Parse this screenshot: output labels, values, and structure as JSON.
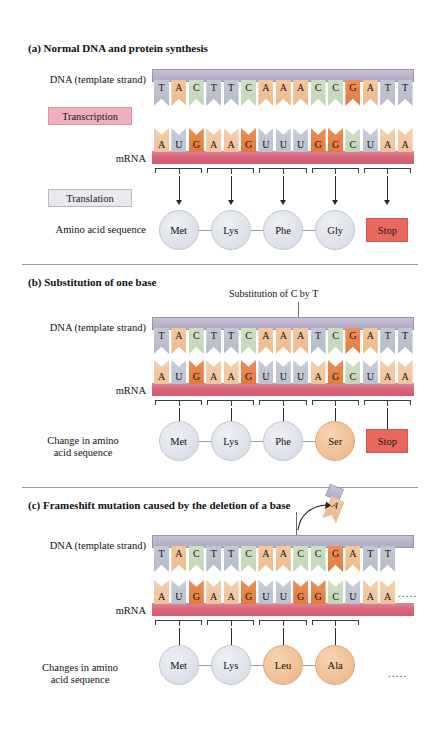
{
  "figure": {
    "type": "biology-diagram"
  },
  "colors": {
    "base_T": "#b6bbc9",
    "base_A": "#eeba8b",
    "base_C": "#c2d6b4",
    "base_G": "#e27a3e",
    "base_U": "#bcc1ce",
    "dna_backbone": "#b3aac4",
    "mrna_backbone": "#d4596f",
    "transcription_box": "#f0afbc",
    "translation_box": "#e8e8ee",
    "amino_acid_normal": "#dfe2ea",
    "amino_acid_changed": "#f0c096",
    "stop_codon": "#e8685f"
  },
  "labels": {
    "dna_strand": "DNA (template strand)",
    "mrna": "mRNA",
    "transcription": "Transcription",
    "translation": "Translation",
    "amino_acid_sequence": "Amino acid sequence",
    "change_in_amino_acid_sequence_line1": "Change in amino",
    "change_in_amino_acid_sequence_line2": "acid sequence",
    "changes_in_amino_acid_sequence_line1": "Changes in amino",
    "changes_in_amino_acid_sequence_line2": "acid sequence",
    "stop": "Stop",
    "ellipsis": "....."
  },
  "panels": [
    {
      "id": "a",
      "marker": "(a)",
      "title": "Normal DNA and protein synthesis",
      "dna_sequence": [
        "T",
        "A",
        "C",
        "T",
        "T",
        "C",
        "A",
        "A",
        "A",
        "C",
        "C",
        "G",
        "A",
        "T",
        "T"
      ],
      "mrna_sequence": [
        "A",
        "U",
        "G",
        "A",
        "A",
        "G",
        "U",
        "U",
        "U",
        "G",
        "G",
        "C",
        "U",
        "A",
        "A"
      ],
      "codons": [
        "AUG",
        "AAG",
        "UUU",
        "GGC",
        "UAA"
      ],
      "amino_acids": [
        {
          "name": "Met",
          "changed": false
        },
        {
          "name": "Lys",
          "changed": false
        },
        {
          "name": "Phe",
          "changed": false
        },
        {
          "name": "Gly",
          "changed": false
        }
      ],
      "terminator": "Stop",
      "annotation": null,
      "trailing_ellipsis": false
    },
    {
      "id": "b",
      "marker": "(b)",
      "title": "Substitution of one base",
      "dna_sequence": [
        "T",
        "A",
        "C",
        "T",
        "T",
        "C",
        "A",
        "A",
        "A",
        "T",
        "C",
        "G",
        "A",
        "T",
        "T"
      ],
      "mrna_sequence": [
        "A",
        "U",
        "G",
        "A",
        "A",
        "G",
        "U",
        "U",
        "U",
        "A",
        "G",
        "C",
        "U",
        "A",
        "A"
      ],
      "codons": [
        "AUG",
        "AAG",
        "UUU",
        "AGC",
        "UAA"
      ],
      "amino_acids": [
        {
          "name": "Met",
          "changed": false
        },
        {
          "name": "Lys",
          "changed": false
        },
        {
          "name": "Phe",
          "changed": false
        },
        {
          "name": "Ser",
          "changed": true
        }
      ],
      "terminator": "Stop",
      "annotation": "Substitution of C by T",
      "annotation_target_index": 9,
      "trailing_ellipsis": false
    },
    {
      "id": "c",
      "marker": "(c)",
      "title": "Frameshift mutation caused by the deletion of a base",
      "dna_sequence": [
        "T",
        "A",
        "C",
        "T",
        "T",
        "C",
        "A",
        "A",
        "C",
        "C",
        "G",
        "A",
        "T",
        "T"
      ],
      "mrna_sequence": [
        "A",
        "U",
        "G",
        "A",
        "A",
        "G",
        "U",
        "U",
        "G",
        "G",
        "C",
        "U",
        "A",
        "A"
      ],
      "codons": [
        "AUG",
        "AAG",
        "UUG",
        "GCU"
      ],
      "amino_acids": [
        {
          "name": "Met",
          "changed": false
        },
        {
          "name": "Lys",
          "changed": false
        },
        {
          "name": "Leu",
          "changed": true
        },
        {
          "name": "Ala",
          "changed": true
        }
      ],
      "terminator": null,
      "deleted_base": "A",
      "deleted_base_index": 8,
      "trailing_ellipsis": true
    }
  ]
}
